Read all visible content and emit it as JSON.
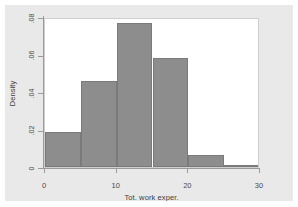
{
  "figure": {
    "background_color": "#e9e9e9",
    "plot_background_color": "#ffffff",
    "bar_fill_color": "#8d8d8d",
    "bar_border_color": "#7a7a7a",
    "axis_color": "#9a9a9a"
  },
  "chart_data": {
    "type": "bar",
    "title": "",
    "subtitle": "",
    "xlabel": "Tot. work exper.",
    "ylabel": "Density",
    "xlim": [
      0,
      30
    ],
    "ylim": [
      0,
      0.08
    ],
    "grid": false,
    "legend": null,
    "bin_width": 5,
    "x_tick_labels": [
      "0",
      "10",
      "20",
      "30"
    ],
    "x_tick_values": [
      0,
      10,
      20,
      30
    ],
    "y_tick_labels": [
      ".08",
      ".06",
      ".04",
      ".02",
      "0"
    ],
    "y_tick_values": [
      0.08,
      0.06,
      0.04,
      0.02,
      0
    ],
    "categories": [
      "0-5",
      "5-10",
      "10-15",
      "15-20",
      "20-25",
      "25-30"
    ],
    "bin_edges": [
      0,
      5,
      10,
      15,
      20,
      25,
      30
    ],
    "values": [
      0.0185,
      0.046,
      0.077,
      0.058,
      0.0065,
      0.0005
    ],
    "annotations": []
  }
}
